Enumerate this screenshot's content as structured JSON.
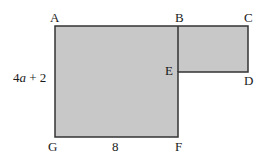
{
  "figure": {
    "type": "composite-rectilinear-polygon",
    "background_color": "#ffffff",
    "fill_color": "#c8c8c8",
    "stroke_color": "#333333",
    "stroke_width": 1.5,
    "outline_points": "55,26 248,26 248,72 178,72 178,137 55,137",
    "internal_segment": {
      "x1": 178,
      "y1": 26,
      "x2": 178,
      "y2": 72
    },
    "vertices": [
      {
        "id": "A",
        "label": "A",
        "x": 55,
        "y": 26,
        "label_x": 50,
        "label_y": 11
      },
      {
        "id": "B",
        "label": "B",
        "x": 178,
        "y": 26,
        "label_x": 175,
        "label_y": 11
      },
      {
        "id": "C",
        "label": "C",
        "x": 248,
        "y": 26,
        "label_x": 244,
        "label_y": 11
      },
      {
        "id": "D",
        "label": "D",
        "x": 248,
        "y": 72,
        "label_x": 244,
        "label_y": 74
      },
      {
        "id": "E",
        "label": "E",
        "x": 178,
        "y": 72,
        "label_x": 165,
        "label_y": 64
      },
      {
        "id": "F",
        "label": "F",
        "x": 178,
        "y": 137,
        "label_x": 175,
        "label_y": 140
      },
      {
        "id": "G",
        "label": "G",
        "x": 55,
        "y": 137,
        "label_x": 48,
        "label_y": 140
      }
    ],
    "dimensions": [
      {
        "id": "left-side",
        "side": "AG",
        "prefix": "4",
        "variable": "a",
        "suffix": " + 2",
        "full_text": "4a + 2",
        "label_x": 13,
        "label_y": 71
      },
      {
        "id": "bottom-side",
        "side": "GF",
        "full_text": "8",
        "label_x": 112,
        "label_y": 140
      }
    ]
  }
}
